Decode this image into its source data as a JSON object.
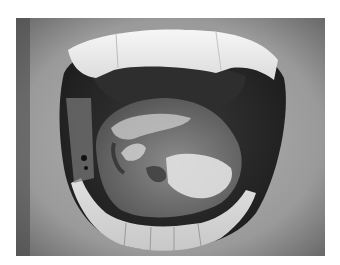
{
  "image": {
    "subject": "open mouth with tongue showing white patchy lesions",
    "colorMode": "grayscale",
    "frame": {
      "x": 16,
      "y": 18,
      "width": 309,
      "height": 238
    },
    "background": "#ffffff"
  }
}
